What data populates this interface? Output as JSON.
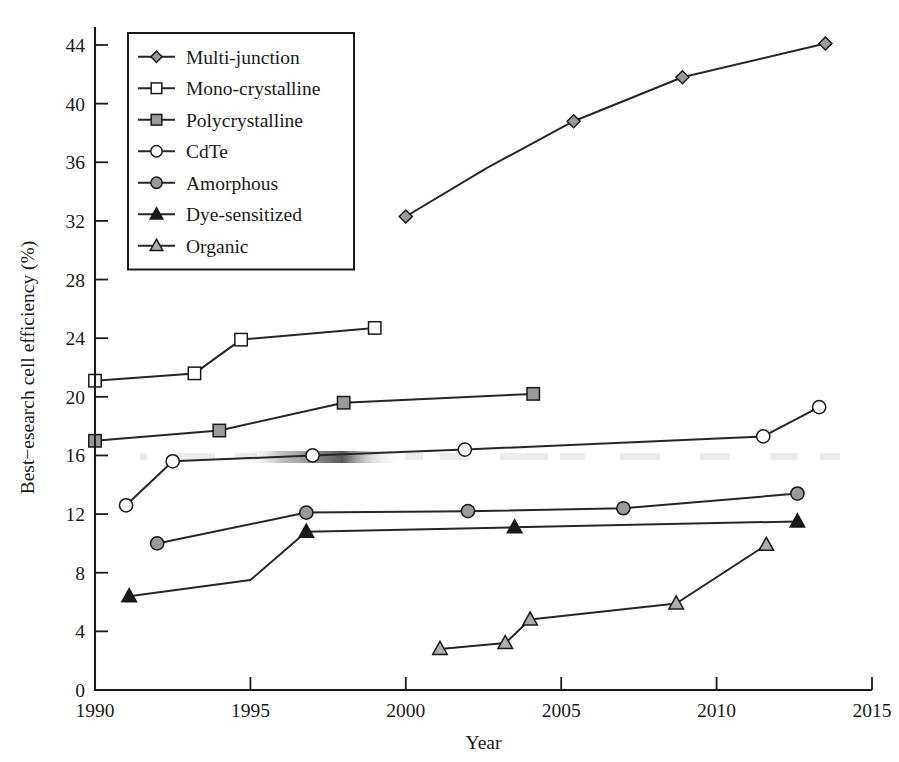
{
  "chart_data": {
    "type": "line",
    "title": "",
    "xlabel": "Year",
    "ylabel": "Best−esearch cell efficiency (%)",
    "xlim": [
      1990,
      2015
    ],
    "ylim": [
      0,
      44
    ],
    "xticks": [
      "1990",
      "1995",
      "2000",
      "2005",
      "2010",
      "2015"
    ],
    "xtick_values": [
      1990,
      1995,
      2000,
      2005,
      2010,
      2015
    ],
    "yticks": [
      "0",
      "4",
      "8",
      "12",
      "16",
      "20",
      "24",
      "28",
      "32",
      "36",
      "40",
      "44"
    ],
    "ytick_values": [
      0,
      4,
      8,
      12,
      16,
      20,
      24,
      28,
      32,
      36,
      40,
      44
    ],
    "grid": false,
    "legend_position": "top-left",
    "series": [
      {
        "name": "Multi-junction",
        "marker": "diamond",
        "marker_fill": "#9a9a9a",
        "x": [
          2000.0,
          2005.4,
          2008.9,
          2013.5
        ],
        "y": [
          32.3,
          38.8,
          41.8,
          44.1
        ],
        "points": [
          {
            "x": 2000.0,
            "y": 32.3
          },
          {
            "x": 2002.6,
            "y": 35.6
          },
          {
            "x": 2005.4,
            "y": 38.8
          },
          {
            "x": 2008.9,
            "y": 41.8
          },
          {
            "x": 2013.5,
            "y": 44.1
          }
        ]
      },
      {
        "name": "Mono-crystalline",
        "marker": "square-open",
        "marker_fill": "#ffffff",
        "x": [
          1990.0,
          1993.2,
          1994.7,
          1999.0
        ],
        "y": [
          21.1,
          21.6,
          23.9,
          24.7
        ],
        "points": [
          {
            "x": 1990.0,
            "y": 21.1
          },
          {
            "x": 1993.2,
            "y": 21.6
          },
          {
            "x": 1994.7,
            "y": 23.9
          },
          {
            "x": 1999.0,
            "y": 24.7
          }
        ]
      },
      {
        "name": "Polycrystalline",
        "marker": "square-filled",
        "marker_fill": "#9a9a9a",
        "x": [
          1990.0,
          1994.0,
          1998.0,
          2004.1
        ],
        "y": [
          17.0,
          17.7,
          19.6,
          20.2
        ],
        "points": [
          {
            "x": 1990.0,
            "y": 17.0
          },
          {
            "x": 1994.0,
            "y": 17.7
          },
          {
            "x": 1998.0,
            "y": 19.6
          },
          {
            "x": 2004.1,
            "y": 20.2
          }
        ]
      },
      {
        "name": "CdTe",
        "marker": "circle-open",
        "marker_fill": "#ffffff",
        "x": [
          1991.0,
          1992.5,
          1997.0,
          2001.9,
          2011.5,
          2013.3
        ],
        "y": [
          12.6,
          15.6,
          16.0,
          16.4,
          17.3,
          19.3
        ],
        "points": [
          {
            "x": 1991.0,
            "y": 12.6
          },
          {
            "x": 1992.5,
            "y": 15.6
          },
          {
            "x": 1997.0,
            "y": 16.0
          },
          {
            "x": 2001.9,
            "y": 16.4
          },
          {
            "x": 2011.5,
            "y": 17.3
          },
          {
            "x": 2013.3,
            "y": 19.3
          }
        ]
      },
      {
        "name": "Amorphous",
        "marker": "circle-filled",
        "marker_fill": "#9a9a9a",
        "x": [
          1992.0,
          1996.8,
          2002.0,
          2007.0,
          2012.6
        ],
        "y": [
          10.0,
          12.1,
          12.2,
          12.4,
          13.4
        ],
        "points": [
          {
            "x": 1992.0,
            "y": 10.0
          },
          {
            "x": 1996.8,
            "y": 12.1
          },
          {
            "x": 2002.0,
            "y": 12.2
          },
          {
            "x": 2007.0,
            "y": 12.4
          },
          {
            "x": 2012.6,
            "y": 13.4
          }
        ]
      },
      {
        "name": "Dye-sensitized",
        "marker": "triangle-filled",
        "marker_fill": "#1a1a1a",
        "x": [
          1991.1,
          1996.8,
          2003.5,
          2012.6
        ],
        "y": [
          6.4,
          10.8,
          11.1,
          11.5
        ],
        "points": [
          {
            "x": 1991.1,
            "y": 6.4
          },
          {
            "x": 1995.0,
            "y": 7.5
          },
          {
            "x": 1996.8,
            "y": 10.8
          },
          {
            "x": 2003.5,
            "y": 11.1
          },
          {
            "x": 2012.6,
            "y": 11.5
          }
        ]
      },
      {
        "name": "Organic",
        "marker": "triangle-grey",
        "marker_fill": "#adadad",
        "x": [
          2001.1,
          2003.2,
          2004.0,
          2008.7,
          2011.6
        ],
        "y": [
          2.8,
          3.2,
          4.8,
          5.9,
          9.9
        ],
        "points": [
          {
            "x": 2001.1,
            "y": 2.8
          },
          {
            "x": 2003.2,
            "y": 3.2
          },
          {
            "x": 2004.0,
            "y": 4.8
          },
          {
            "x": 2008.7,
            "y": 5.9
          },
          {
            "x": 2011.6,
            "y": 9.9
          }
        ]
      }
    ],
    "colors": {
      "line": "#262626",
      "axis": "#1a1a1a",
      "marker_grey": "#9a9a9a",
      "marker_light": "#adadad",
      "marker_dark": "#1a1a1a",
      "background": "#ffffff"
    }
  }
}
